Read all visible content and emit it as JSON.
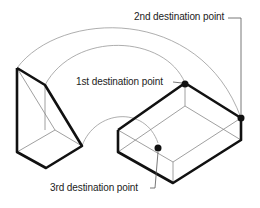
{
  "labels": {
    "first": "1st destination point",
    "second": "2nd destination point",
    "third": "3rd destination point"
  },
  "colors": {
    "thick": "#111111",
    "thin": "#888888",
    "point": "#111111"
  }
}
